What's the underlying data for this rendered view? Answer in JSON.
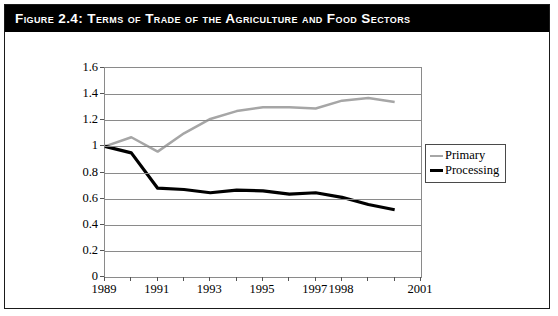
{
  "figure": {
    "title": "Figure 2.4:  Terms of Trade of the Agriculture and Food Sectors",
    "title_bar_color": "#000000",
    "title_text_color": "#ffffff",
    "border_color": "#1a1a1a",
    "background_color": "#ffffff"
  },
  "legend": {
    "position": "right-middle",
    "entries": [
      {
        "label": "Primary",
        "color": "#a6a6a6"
      },
      {
        "label": "Processing",
        "color": "#000000"
      }
    ]
  },
  "chart_data": {
    "type": "line",
    "title": "Figure 2.4:  Terms of Trade of the Agriculture and Food Sectors",
    "xlabel": "",
    "ylabel": "",
    "grid": true,
    "legend_position": "right-middle",
    "xlim": [
      1989,
      2001
    ],
    "ylim": [
      0,
      1.6
    ],
    "ytick_values": [
      0,
      0.2,
      0.4,
      0.6,
      0.8,
      1,
      1.2,
      1.4,
      1.6
    ],
    "ytick_labels": [
      "0",
      "0.2",
      "0.4",
      "0.6",
      "0.8",
      "1",
      "1.2",
      "1.4",
      "1.6"
    ],
    "xtick_values": [
      1989,
      1990,
      1991,
      1992,
      1993,
      1994,
      1995,
      1996,
      1997,
      1998,
      1999,
      2000,
      2001
    ],
    "xtick_labels_shown": [
      {
        "value": 1989,
        "label": "1989"
      },
      {
        "value": 1991,
        "label": "1991"
      },
      {
        "value": 1993,
        "label": "1993"
      },
      {
        "value": 1995,
        "label": "1995"
      },
      {
        "value": 1997,
        "label": "1997"
      },
      {
        "value": 1998,
        "label": "1998"
      },
      {
        "value": 2001,
        "label": "2001"
      }
    ],
    "x": [
      1989,
      1990,
      1991,
      1992,
      1993,
      1994,
      1995,
      1996,
      1997,
      1998,
      1999,
      2000
    ],
    "series": [
      {
        "name": "Primary",
        "color": "#a6a6a6",
        "width": 2.5,
        "values": [
          1.0,
          1.07,
          0.96,
          1.1,
          1.21,
          1.27,
          1.3,
          1.3,
          1.29,
          1.35,
          1.37,
          1.34
        ]
      },
      {
        "name": "Processing",
        "color": "#000000",
        "width": 3.2,
        "values": [
          1.0,
          0.95,
          0.68,
          0.67,
          0.645,
          0.665,
          0.66,
          0.635,
          0.645,
          0.61,
          0.555,
          0.515
        ]
      }
    ]
  }
}
